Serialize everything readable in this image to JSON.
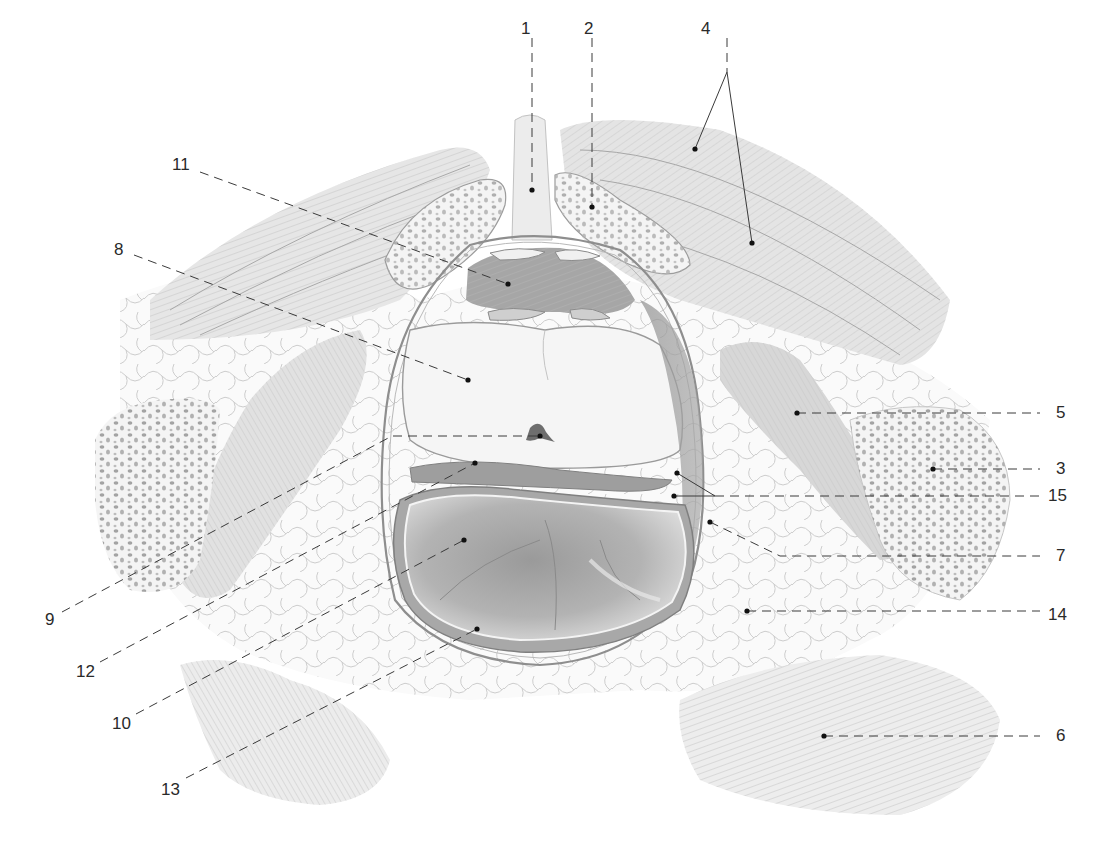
{
  "figure": {
    "type": "anatomical-illustration",
    "style": "pencil drawing, grayscale",
    "view": "transverse section through the pelvis (prostate / rectum level)",
    "colors": {
      "background": "#ffffff",
      "ink": "#2a2a2a",
      "leader": "#3a3a3a",
      "muscle": "#d9d9d9",
      "bone_fill": "#f3f3f3",
      "bone_pores": "#9a9a9a",
      "fat": "#f7f7f7",
      "fat_lines": "#b5b5b5",
      "lumen_dark": "#8c8c8c",
      "lumen_mid": "#b8b8b8",
      "prostate": "#f2f2f2"
    }
  },
  "labels": [
    {
      "id": "1",
      "text": "1",
      "x": 521,
      "y": 20,
      "targets": [
        [
          532,
          190
        ]
      ],
      "leader": [
        [
          532,
          38
        ],
        [
          532,
          190
        ]
      ]
    },
    {
      "id": "2",
      "text": "2",
      "x": 584,
      "y": 20,
      "targets": [
        [
          592,
          207
        ]
      ],
      "leader": [
        [
          592,
          38
        ],
        [
          592,
          207
        ]
      ]
    },
    {
      "id": "4",
      "text": "4",
      "x": 701,
      "y": 20,
      "targets": [
        [
          695,
          149
        ],
        [
          752,
          243
        ]
      ],
      "leader": [
        [
          727,
          38
        ],
        [
          727,
          72
        ]
      ],
      "branches": [
        [
          [
            727,
            72
          ],
          [
            695,
            149
          ]
        ],
        [
          [
            727,
            72
          ],
          [
            752,
            243
          ]
        ]
      ]
    },
    {
      "id": "11",
      "text": "11",
      "x": 172,
      "y": 156,
      "targets": [
        [
          508,
          284
        ]
      ],
      "leader": [
        [
          200,
          172
        ],
        [
          508,
          284
        ]
      ]
    },
    {
      "id": "8",
      "text": "8",
      "x": 114,
      "y": 241,
      "targets": [
        [
          468,
          380
        ]
      ],
      "leader": [
        [
          134,
          255
        ],
        [
          468,
          380
        ]
      ]
    },
    {
      "id": "5",
      "text": "5",
      "x": 1056,
      "y": 404,
      "targets": [
        [
          797,
          413
        ]
      ],
      "leader": [
        [
          797,
          413
        ],
        [
          1040,
          413
        ]
      ]
    },
    {
      "id": "3",
      "text": "3",
      "x": 1056,
      "y": 460,
      "targets": [
        [
          933,
          469
        ]
      ],
      "leader": [
        [
          933,
          469
        ],
        [
          1040,
          469
        ]
      ]
    },
    {
      "id": "15",
      "text": "15",
      "x": 1048,
      "y": 487,
      "targets": [
        [
          677,
          473
        ],
        [
          674,
          496
        ]
      ],
      "leader": [
        [
          715,
          496
        ],
        [
          1040,
          496
        ]
      ],
      "branches": [
        [
          [
            715,
            496
          ],
          [
            677,
            473
          ]
        ],
        [
          [
            715,
            496
          ],
          [
            674,
            496
          ]
        ]
      ]
    },
    {
      "id": "7",
      "text": "7",
      "x": 1056,
      "y": 547,
      "targets": [
        [
          710,
          522
        ]
      ],
      "leader": [
        [
          710,
          522
        ],
        [
          780,
          556
        ],
        [
          1040,
          556
        ]
      ]
    },
    {
      "id": "14",
      "text": "14",
      "x": 1048,
      "y": 606,
      "targets": [
        [
          747,
          611
        ]
      ],
      "leader": [
        [
          747,
          611
        ],
        [
          1040,
          611
        ]
      ]
    },
    {
      "id": "6",
      "text": "6",
      "x": 1056,
      "y": 727,
      "targets": [
        [
          824,
          736
        ]
      ],
      "leader": [
        [
          824,
          736
        ],
        [
          1040,
          736
        ]
      ]
    },
    {
      "id": "9",
      "text": "9",
      "x": 45,
      "y": 611,
      "targets": [
        [
          540,
          436
        ]
      ],
      "leader": [
        [
          62,
          612
        ],
        [
          392,
          436
        ],
        [
          540,
          436
        ]
      ]
    },
    {
      "id": "12",
      "text": "12",
      "x": 76,
      "y": 663,
      "targets": [
        [
          475,
          463
        ]
      ],
      "leader": [
        [
          100,
          662
        ],
        [
          475,
          463
        ]
      ]
    },
    {
      "id": "10",
      "text": "10",
      "x": 112,
      "y": 715,
      "targets": [
        [
          464,
          540
        ]
      ],
      "leader": [
        [
          136,
          714
        ],
        [
          464,
          540
        ]
      ]
    },
    {
      "id": "13",
      "text": "13",
      "x": 161,
      "y": 781,
      "targets": [
        [
          477,
          629
        ]
      ],
      "leader": [
        [
          186,
          778
        ],
        [
          477,
          629
        ]
      ]
    }
  ]
}
